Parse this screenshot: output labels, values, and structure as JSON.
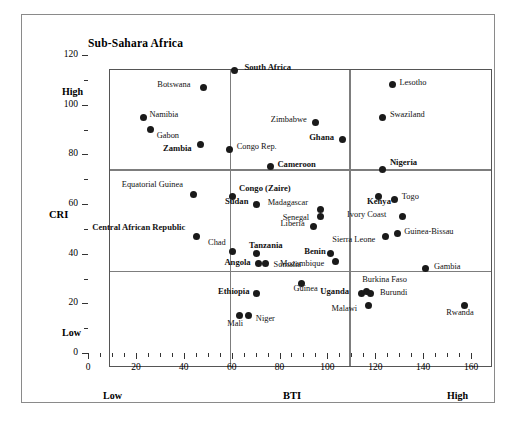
{
  "chart_data": {
    "type": "scatter",
    "title": "Sub-Sahara Africa",
    "xlabel": "BTI",
    "ylabel": "CRI",
    "xlim": [
      0,
      160
    ],
    "ylim": [
      0,
      120
    ],
    "xticks": [
      0,
      20,
      40,
      60,
      80,
      100,
      120,
      140,
      160
    ],
    "yticks": [
      0,
      20,
      40,
      60,
      80,
      100,
      120
    ],
    "x_minor_step": 5,
    "y_minor_step": 10,
    "grid": false,
    "legend": "none",
    "axis_end_labels": {
      "x_low": "Low",
      "x_high": "High",
      "y_low": "Low",
      "y_high": "High"
    },
    "quadrant_lines": {
      "vertical": [
        50,
        100
      ],
      "horizontal": [
        39,
        80
      ]
    },
    "points": [
      {
        "label": "South Africa",
        "x": 52,
        "y": 120,
        "bold": true,
        "lx": 10,
        "ly": -3
      },
      {
        "label": "Botswana",
        "x": 39,
        "y": 113,
        "bold": false,
        "lx": -46,
        "ly": -3
      },
      {
        "label": "Namibia",
        "x": 14,
        "y": 101,
        "bold": false,
        "lx": 6,
        "ly": -3
      },
      {
        "label": "Gabon",
        "x": 17,
        "y": 96,
        "bold": false,
        "lx": 6,
        "ly": 5
      },
      {
        "label": "Zambia",
        "x": 38,
        "y": 90,
        "bold": true,
        "lx": -38,
        "ly": 3
      },
      {
        "label": "Zimbabwe",
        "x": 86,
        "y": 99,
        "bold": false,
        "lx": -45,
        "ly": -3
      },
      {
        "label": "Swaziland",
        "x": 114,
        "y": 101,
        "bold": false,
        "lx": 7,
        "ly": -3
      },
      {
        "label": "Lesotho",
        "x": 118,
        "y": 114,
        "bold": false,
        "lx": 7,
        "ly": -3
      },
      {
        "label": "Ghana",
        "x": 97,
        "y": 92,
        "bold": true,
        "lx": -33,
        "ly": -3
      },
      {
        "label": "Congo Rep.",
        "x": 50,
        "y": 88,
        "bold": false,
        "lx": 7,
        "ly": -3
      },
      {
        "label": "Cameroon",
        "x": 67,
        "y": 81,
        "bold": true,
        "lx": 7,
        "ly": -3
      },
      {
        "label": "Nigeria",
        "x": 114,
        "y": 80,
        "bold": true,
        "lx": 7,
        "ly": -7
      },
      {
        "label": "Equatorial Guinea",
        "x": 35,
        "y": 70,
        "bold": false,
        "lx": -72,
        "ly": -10
      },
      {
        "label": "Congo (Zaire)",
        "x": 51,
        "y": 69,
        "bold": true,
        "lx": 7,
        "ly": -9
      },
      {
        "label": "Sudan",
        "x": 61,
        "y": 66,
        "bold": true,
        "lx": -31,
        "ly": -3
      },
      {
        "label": "Madagascar",
        "x": 88,
        "y": 64,
        "bold": false,
        "lx": -53,
        "ly": -7
      },
      {
        "label": "Senegal",
        "x": 88,
        "y": 61,
        "bold": false,
        "lx": -38,
        "ly": 0
      },
      {
        "label": "Togo",
        "x": 119,
        "y": 68,
        "bold": false,
        "lx": 7,
        "ly": -3
      },
      {
        "label": "Kenya",
        "x": 112,
        "y": 69,
        "bold": true,
        "lx": -11,
        "ly": 4
      },
      {
        "label": "Liberia",
        "x": 85,
        "y": 57,
        "bold": false,
        "lx": -33,
        "ly": -3
      },
      {
        "label": "Ivory  Coast",
        "x": 122,
        "y": 61,
        "bold": false,
        "lx": -55,
        "ly": -3
      },
      {
        "label": "Guinea-Bissau",
        "x": 120,
        "y": 54,
        "bold": false,
        "lx": 7,
        "ly": -3
      },
      {
        "label": "Central African Republic",
        "x": 36,
        "y": 53,
        "bold": true,
        "lx": -104,
        "ly": -9
      },
      {
        "label": "Chad",
        "x": 51,
        "y": 47,
        "bold": false,
        "lx": -24,
        "ly": -9
      },
      {
        "label": "Tanzania",
        "x": 61,
        "y": 46,
        "bold": true,
        "lx": -7,
        "ly": -9
      },
      {
        "label": "Sierra Leone",
        "x": 115,
        "y": 53,
        "bold": false,
        "lx": -53,
        "ly": 3
      },
      {
        "label": "Benin",
        "x": 92,
        "y": 46,
        "bold": true,
        "lx": -26,
        "ly": -3
      },
      {
        "label": "Angola",
        "x": 62,
        "y": 42,
        "bold": true,
        "lx": -34,
        "ly": -2
      },
      {
        "label": "Somalia",
        "x": 65,
        "y": 42,
        "bold": false,
        "lx": 8,
        "ly": 0
      },
      {
        "label": "Mozambique",
        "x": 94,
        "y": 43,
        "bold": false,
        "lx": -55,
        "ly": 2
      },
      {
        "label": "Gambia",
        "x": 132,
        "y": 40,
        "bold": false,
        "lx": 8,
        "ly": -3
      },
      {
        "label": "Guinea",
        "x": 80,
        "y": 34,
        "bold": false,
        "lx": -8,
        "ly": 4
      },
      {
        "label": "Burkina Faso",
        "x": 107,
        "y": 31,
        "bold": false,
        "lx": -4,
        "ly": -12
      },
      {
        "label": "Uganda",
        "x": 105,
        "y": 30,
        "bold": true,
        "lx": -41,
        "ly": -3
      },
      {
        "label": "Burundi",
        "x": 109,
        "y": 30,
        "bold": false,
        "lx": 9,
        "ly": -2
      },
      {
        "label": "Ethiopia",
        "x": 61,
        "y": 30,
        "bold": true,
        "lx": -38,
        "ly": -3
      },
      {
        "label": "Malawi",
        "x": 108,
        "y": 25,
        "bold": false,
        "lx": -37,
        "ly": 2
      },
      {
        "label": "Rwanda",
        "x": 148,
        "y": 25,
        "bold": false,
        "lx": -18,
        "ly": 6
      },
      {
        "label": "Niger",
        "x": 58,
        "y": 21,
        "bold": false,
        "lx": 7,
        "ly": 2
      },
      {
        "label": "Mali",
        "x": 54,
        "y": 21,
        "bold": false,
        "lx": -12,
        "ly": 7
      }
    ]
  }
}
